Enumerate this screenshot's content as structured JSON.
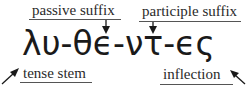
{
  "diagram": {
    "type": "morphological-breakdown",
    "word": "λυ-θϵ-ντ-ϵς",
    "labels": {
      "passive_suffix": "passive suffix",
      "participle_suffix": "participle suffix",
      "tense_stem": "tense stem",
      "inflection": "inflection"
    },
    "segments": [
      {
        "text": "λυ",
        "role": "tense stem"
      },
      {
        "text": "θϵ",
        "role": "passive suffix"
      },
      {
        "text": "ντ",
        "role": "participle suffix"
      },
      {
        "text": "ϵς",
        "role": "inflection"
      }
    ],
    "colors": {
      "text": "#1a1a1a",
      "label": "#2a2a2a",
      "line": "#555555",
      "background": "#ffffff"
    }
  }
}
